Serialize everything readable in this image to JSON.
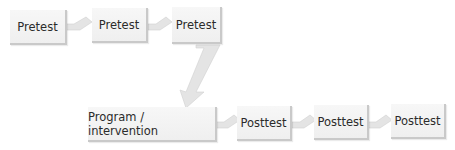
{
  "diagram": {
    "type": "flow",
    "top_row": [
      {
        "label": "Pretest"
      },
      {
        "label": "Pretest"
      },
      {
        "label": "Pretest"
      }
    ],
    "intervention": {
      "label": "Program / intervention"
    },
    "bottom_row": [
      {
        "label": "Posttest"
      },
      {
        "label": "Posttest"
      },
      {
        "label": "Posttest"
      }
    ],
    "colors": {
      "box_fill": "#f2f2f2",
      "box_edge": "#c9c9c9",
      "connector": "#e3e3e3",
      "text": "#2b2b2b"
    }
  }
}
